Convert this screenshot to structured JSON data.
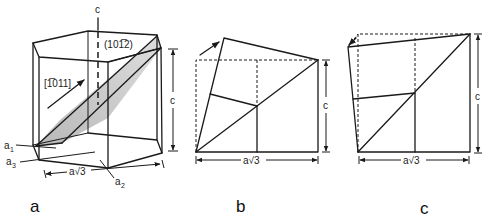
{
  "figure": {
    "panels": [
      {
        "id": "a",
        "label": "a",
        "axis_c": "c",
        "plane_label": "(10̅2)",
        "plane_index": "(101̅2)",
        "direction_label": "[1̅011]",
        "axes": {
          "a1": "a",
          "a1_sub": "1",
          "a2": "a",
          "a2_sub": "2",
          "a3": "a",
          "a3_sub": "3"
        },
        "dim_width": "a√3",
        "dim_height": "c"
      },
      {
        "id": "b",
        "label": "b",
        "dim_width": "a√3",
        "dim_height": "c"
      },
      {
        "id": "c",
        "label": "c",
        "dim_width": "a√3",
        "dim_height": "c"
      }
    ],
    "colors": {
      "line": "#1a1a1a",
      "shade": "#c8c8c8",
      "background": "#ffffff"
    }
  }
}
